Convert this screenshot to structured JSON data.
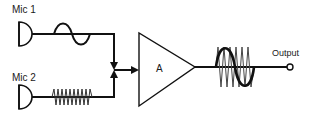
{
  "diagram": {
    "inputs": [
      {
        "label": "Mic 1",
        "signal": "low-frequency sine wave"
      },
      {
        "label": "Mic 2",
        "signal": "high-frequency zigzag wave"
      }
    ],
    "amplifier": {
      "label": "A"
    },
    "output": {
      "label": "Output",
      "signal": "mixed sine + high-frequency wave"
    },
    "colors": {
      "stroke": "#111111",
      "background": "#ffffff"
    }
  }
}
